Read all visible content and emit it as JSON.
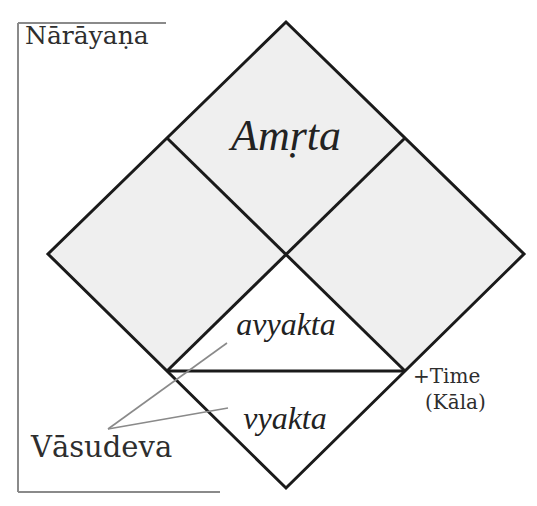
{
  "diagram": {
    "bracket_label": "Nārāyaṇa",
    "regions": {
      "top": "Amṛta",
      "middle_lower": "avyakta",
      "bottom": "vyakta"
    },
    "pointer_label": "Vāsudeva",
    "time_label": "+Time",
    "kala_label": "(Kāla)",
    "colors": {
      "fill": "#efefef",
      "stroke": "#1a1a1a",
      "bracket": "#8a8a8a",
      "pointer": "#8a8a8a",
      "text": "#2e2e2e"
    }
  }
}
